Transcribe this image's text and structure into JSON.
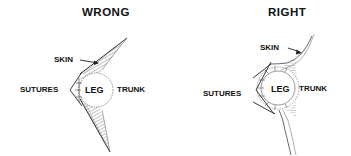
{
  "diagram": {
    "panels": [
      {
        "id": "wrong",
        "title": "WRONG",
        "labels": {
          "skin": "SKIN",
          "sutures": "SUTURES",
          "leg": "LEG",
          "trunk": "TRUNK"
        }
      },
      {
        "id": "right",
        "title": "RIGHT",
        "labels": {
          "skin": "SKIN",
          "sutures": "SUTURES",
          "leg": "LEG",
          "trunk": "TRUNK"
        }
      }
    ],
    "colors": {
      "ink": "#111111",
      "hatch": "#555555",
      "background": "#ffffff"
    }
  }
}
